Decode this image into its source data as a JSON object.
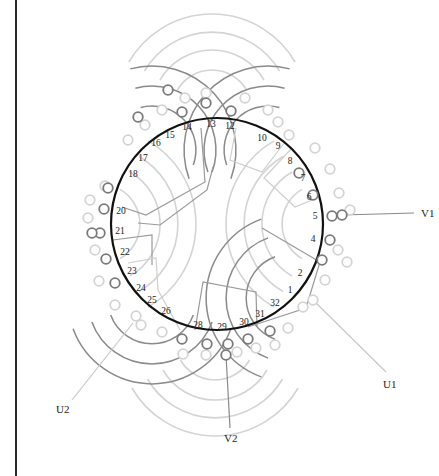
{
  "diagram": {
    "title": "",
    "colors": {
      "background": "#ffffff",
      "stator_ring": "#111111",
      "phase_dark": "#8a8a8a",
      "phase_light": "#d4d4d4",
      "boundary": "#9a9a9a",
      "boundary_light": "#cfcfcf",
      "label": "#222222",
      "frame": "#2a2a2a"
    },
    "stator": {
      "cx": 217,
      "cy": 224,
      "r": 106
    },
    "slot_labels": [
      {
        "n": "1",
        "x": 290,
        "y": 293
      },
      {
        "n": "2",
        "x": 300,
        "y": 276
      },
      {
        "n": "4",
        "x": 313,
        "y": 242
      },
      {
        "n": "5",
        "x": 315,
        "y": 219
      },
      {
        "n": "6",
        "x": 309,
        "y": 200
      },
      {
        "n": "7",
        "x": 303,
        "y": 181
      },
      {
        "n": "8",
        "x": 290,
        "y": 164
      },
      {
        "n": "9",
        "x": 278,
        "y": 149
      },
      {
        "n": "10",
        "x": 262,
        "y": 141
      },
      {
        "n": "12",
        "x": 230,
        "y": 129
      },
      {
        "n": "13",
        "x": 211,
        "y": 127
      },
      {
        "n": "14",
        "x": 187,
        "y": 130
      },
      {
        "n": "15",
        "x": 170,
        "y": 138
      },
      {
        "n": "16",
        "x": 156,
        "y": 146
      },
      {
        "n": "17",
        "x": 143,
        "y": 161
      },
      {
        "n": "18",
        "x": 133,
        "y": 177
      },
      {
        "n": "20",
        "x": 121,
        "y": 214
      },
      {
        "n": "21",
        "x": 120,
        "y": 234
      },
      {
        "n": "22",
        "x": 125,
        "y": 255
      },
      {
        "n": "23",
        "x": 132,
        "y": 274
      },
      {
        "n": "24",
        "x": 141,
        "y": 291
      },
      {
        "n": "25",
        "x": 152,
        "y": 303
      },
      {
        "n": "26",
        "x": 166,
        "y": 314
      },
      {
        "n": "28",
        "x": 198,
        "y": 328
      },
      {
        "n": "29",
        "x": 222,
        "y": 330
      },
      {
        "n": "30",
        "x": 244,
        "y": 325
      },
      {
        "n": "31",
        "x": 260,
        "y": 317
      },
      {
        "n": "32",
        "x": 275,
        "y": 306
      }
    ],
    "phase_groups": [
      {
        "name": "phase-dark-upper-right",
        "tone": "dark",
        "cx": 268,
        "cy": 150,
        "radii": [
          44,
          64,
          84
        ],
        "start_deg": 200,
        "end_deg": 75
      },
      {
        "name": "phase-dark-upper-left",
        "tone": "dark",
        "cx": 152,
        "cy": 150,
        "radii": [
          44,
          64,
          84
        ],
        "start_deg": 105,
        "end_deg": -20
      },
      {
        "name": "phase-dark-lower-left",
        "tone": "dark",
        "cx": 152,
        "cy": 300,
        "radii": [
          44,
          64,
          84
        ],
        "start_deg": -20,
        "end_deg": -160
      },
      {
        "name": "phase-dark-lower-right",
        "tone": "dark",
        "cx": 290,
        "cy": 298,
        "radii": [
          44,
          64,
          84
        ],
        "start_deg": -110,
        "end_deg": 110
      },
      {
        "name": "phase-light-top",
        "tone": "light",
        "cx": 212,
        "cy": 110,
        "radii": [
          40,
          60,
          78,
          96
        ],
        "start_deg": 150,
        "end_deg": 30
      },
      {
        "name": "phase-light-right",
        "tone": "light",
        "cx": 322,
        "cy": 224,
        "radii": [
          40,
          60,
          78,
          96
        ],
        "start_deg": 240,
        "end_deg": 120
      },
      {
        "name": "phase-light-bottom",
        "tone": "light",
        "cx": 215,
        "cy": 340,
        "radii": [
          40,
          60,
          78,
          96
        ],
        "start_deg": -30,
        "end_deg": -150
      },
      {
        "name": "phase-light-left",
        "tone": "light",
        "cx": 100,
        "cy": 224,
        "radii": [
          40,
          60,
          78,
          96
        ],
        "start_deg": 60,
        "end_deg": -60
      }
    ],
    "terminals_dark": [
      [
        182,
        112
      ],
      [
        206,
        103
      ],
      [
        231,
        111
      ],
      [
        299,
        173
      ],
      [
        313,
        195
      ],
      [
        332,
        216
      ],
      [
        342,
        215
      ],
      [
        330,
        240
      ],
      [
        322,
        260
      ],
      [
        270,
        331
      ],
      [
        248,
        339
      ],
      [
        228,
        344
      ],
      [
        226,
        355
      ],
      [
        207,
        344
      ],
      [
        182,
        339
      ],
      [
        115,
        283
      ],
      [
        106,
        259
      ],
      [
        100,
        233
      ],
      [
        92,
        233
      ],
      [
        104,
        209
      ],
      [
        108,
        188
      ],
      [
        168,
        90
      ],
      [
        138,
        117
      ]
    ],
    "terminals_light": [
      [
        162,
        110
      ],
      [
        185,
        98
      ],
      [
        206,
        93
      ],
      [
        245,
        98
      ],
      [
        268,
        110
      ],
      [
        278,
        122
      ],
      [
        289,
        135
      ],
      [
        315,
        148
      ],
      [
        330,
        169
      ],
      [
        339,
        193
      ],
      [
        350,
        210
      ],
      [
        338,
        250
      ],
      [
        347,
        262
      ],
      [
        325,
        280
      ],
      [
        313,
        300
      ],
      [
        303,
        307
      ],
      [
        288,
        328
      ],
      [
        275,
        345
      ],
      [
        256,
        348
      ],
      [
        237,
        352
      ],
      [
        206,
        355
      ],
      [
        183,
        354
      ],
      [
        162,
        332
      ],
      [
        141,
        325
      ],
      [
        136,
        316
      ],
      [
        115,
        305
      ],
      [
        99,
        281
      ],
      [
        95,
        250
      ],
      [
        88,
        218
      ],
      [
        90,
        200
      ],
      [
        105,
        186
      ],
      [
        128,
        140
      ],
      [
        145,
        125
      ]
    ],
    "phase_boundaries": [
      {
        "tone": "dark",
        "points": [
          [
            201,
            128
          ],
          [
            205,
            182
          ],
          [
            146,
            215
          ],
          [
            122,
            207
          ]
        ]
      },
      {
        "tone": "dark",
        "points": [
          [
            213,
            167
          ],
          [
            207,
            190
          ],
          [
            160,
            225
          ],
          [
            138,
            223
          ]
        ]
      },
      {
        "tone": "dark",
        "points": [
          [
            113,
            240
          ],
          [
            152,
            235
          ],
          [
            152,
            265
          ]
        ]
      },
      {
        "tone": "light",
        "points": [
          [
            128,
            263
          ],
          [
            156,
            258
          ],
          [
            158,
            290
          ],
          [
            180,
            330
          ]
        ]
      },
      {
        "tone": "dark",
        "points": [
          [
            195,
            330
          ],
          [
            203,
            282
          ],
          [
            256,
            292
          ],
          [
            257,
            326
          ]
        ]
      },
      {
        "tone": "dark",
        "points": [
          [
            262,
            228
          ],
          [
            320,
            262
          ],
          [
            306,
            308
          ],
          [
            248,
            327
          ]
        ]
      },
      {
        "tone": "light",
        "points": [
          [
            236,
            128
          ],
          [
            230,
            160
          ],
          [
            262,
            172
          ],
          [
            285,
            142
          ]
        ]
      },
      {
        "tone": "light",
        "points": [
          [
            292,
            148
          ],
          [
            264,
            178
          ],
          [
            295,
            207
          ],
          [
            312,
            200
          ]
        ]
      }
    ],
    "leads": [
      {
        "label": "V1",
        "from": [
          342,
          215
        ],
        "to": [
          414,
          213
        ],
        "label_x": 421,
        "label_y": 217,
        "tone": "dark"
      },
      {
        "label": "U1",
        "from": [
          313,
          300
        ],
        "to": [
          386,
          372
        ],
        "label_x": 383,
        "label_y": 388,
        "tone": "light"
      },
      {
        "label": "U2",
        "from": [
          133,
          323
        ],
        "to": [
          72,
          400
        ],
        "label_x": 56,
        "label_y": 413,
        "tone": "light"
      },
      {
        "label": "V2",
        "from": [
          226,
          355
        ],
        "to": [
          230,
          428
        ],
        "label_x": 224,
        "label_y": 442,
        "tone": "dark"
      }
    ]
  }
}
